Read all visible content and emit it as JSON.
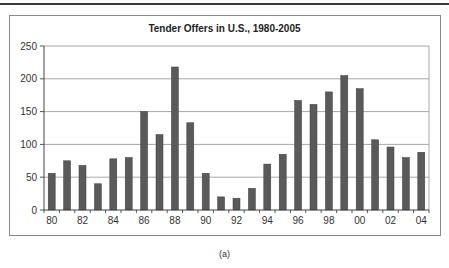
{
  "figure": {
    "caption": "(a)"
  },
  "chart_data": {
    "type": "bar",
    "title": "Tender Offers in U.S., 1980-2005",
    "xlabel": "",
    "ylabel": "",
    "ylim": [
      0,
      250
    ],
    "yticks": [
      0,
      50,
      100,
      150,
      200,
      250
    ],
    "grid": true,
    "legend": null,
    "bar_color": "#5a5a5a",
    "categories": [
      "80",
      "81",
      "82",
      "83",
      "84",
      "85",
      "86",
      "87",
      "88",
      "89",
      "90",
      "91",
      "92",
      "93",
      "94",
      "95",
      "96",
      "97",
      "98",
      "99",
      "00",
      "01",
      "02",
      "03",
      "04"
    ],
    "xtick_labels": [
      "80",
      "82",
      "84",
      "86",
      "88",
      "90",
      "92",
      "94",
      "96",
      "98",
      "00",
      "02",
      "04"
    ],
    "values": [
      56,
      75,
      68,
      40,
      78,
      80,
      150,
      115,
      218,
      133,
      56,
      20,
      18,
      33,
      70,
      85,
      167,
      161,
      180,
      205,
      185,
      107,
      96,
      80,
      88
    ]
  }
}
